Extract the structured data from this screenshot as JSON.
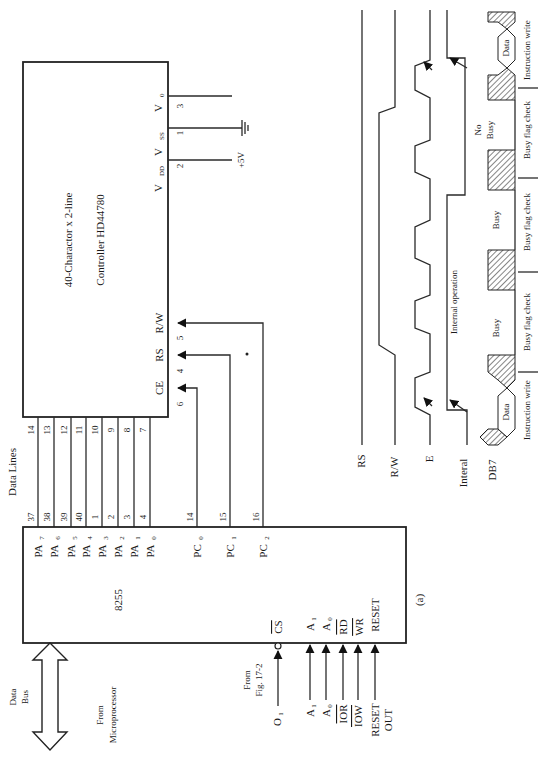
{
  "figure": {
    "caption": "(a)",
    "orientation": "rotated 90° counter-clockwise"
  },
  "lcd": {
    "title": "40-Charactor x 2-line",
    "controller": "Controller HD44780",
    "power_pins": [
      {
        "name": "V",
        "sub": "0",
        "pin": "3",
        "connect": ""
      },
      {
        "name": "V",
        "sub": "SS",
        "pin": "1",
        "connect": "ground"
      },
      {
        "name": "V",
        "sub": "DD",
        "pin": "2",
        "connect": "+5V"
      }
    ],
    "control_pins": [
      {
        "name": "R/W",
        "pin": "5"
      },
      {
        "name": "RS",
        "pin": "4"
      },
      {
        "name": "CE",
        "pin": "6"
      }
    ],
    "data_pins": [
      "14",
      "13",
      "12",
      "11",
      "10",
      "9",
      "8",
      "7"
    ]
  },
  "data_lines_label": "Data Lines",
  "ppi": {
    "name": "8255",
    "port_a": [
      {
        "name": "PA",
        "sub": "7",
        "pin": "37"
      },
      {
        "name": "PA",
        "sub": "6",
        "pin": "38"
      },
      {
        "name": "PA",
        "sub": "5",
        "pin": "39"
      },
      {
        "name": "PA",
        "sub": "4",
        "pin": "40"
      },
      {
        "name": "PA",
        "sub": "3",
        "pin": "1"
      },
      {
        "name": "PA",
        "sub": "2",
        "pin": "2"
      },
      {
        "name": "PA",
        "sub": "1",
        "pin": "3"
      },
      {
        "name": "PA",
        "sub": "0",
        "pin": "4"
      }
    ],
    "port_c": [
      {
        "name": "PC",
        "sub": "0",
        "pin": "14"
      },
      {
        "name": "PC",
        "sub": "1",
        "pin": "15"
      },
      {
        "name": "PC",
        "sub": "2",
        "pin": "16"
      }
    ],
    "inputs": [
      {
        "pin_label": "CS",
        "overbar": true,
        "source": "O",
        "source_sub": "1"
      },
      {
        "pin_label": "A",
        "pin_sub": "1",
        "source": "A",
        "source_sub": "1"
      },
      {
        "pin_label": "A",
        "pin_sub": "0",
        "source": "A",
        "source_sub": "0"
      },
      {
        "pin_label": "RD",
        "overbar": true,
        "source": "IOR",
        "source_overbar": true
      },
      {
        "pin_label": "WR",
        "overbar": true,
        "source": "IOW",
        "source_overbar": true
      },
      {
        "pin_label": "RESET",
        "source": "RESET",
        "source_line2": "OUT"
      }
    ]
  },
  "external": {
    "from_fig": [
      "From",
      "Fig. 17-2"
    ],
    "data_bus": [
      "Data",
      "Bus"
    ],
    "from_micro": [
      "From",
      "Microprocessor"
    ],
    "plus5v": "+5V"
  },
  "timing": {
    "signals": [
      "RS",
      "R/W",
      "E",
      "Interal",
      "DB7"
    ],
    "internal_operation": "Internal operation",
    "db7_segments": [
      "Data",
      "Busy",
      "Busy",
      "No",
      "Busy",
      "Data"
    ],
    "phases": [
      "Instruction write",
      "Busy flag check",
      "Busy flag check",
      "Busy flag check",
      "Instruction write"
    ]
  }
}
